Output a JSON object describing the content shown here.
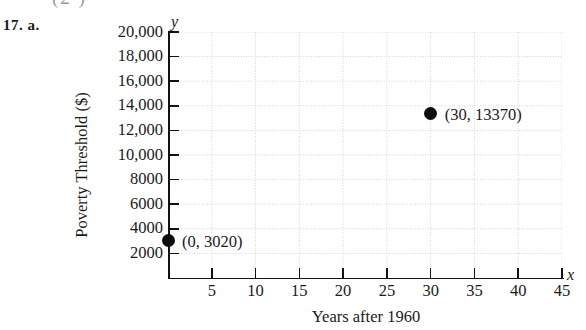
{
  "page": {
    "top_fragment": "(2    )",
    "exercise_label": "17. a."
  },
  "chart_data": {
    "type": "scatter",
    "title": "",
    "xlabel": "Years after 1960",
    "ylabel": "Poverty Threshold ($)",
    "x_axis_symbol": "x",
    "y_axis_symbol": "y",
    "xlim": [
      0,
      45
    ],
    "ylim": [
      0,
      20000
    ],
    "grid": true,
    "grid_style": "dotted",
    "legend": "none",
    "x_ticks": [
      5,
      10,
      15,
      20,
      25,
      30,
      35,
      40,
      45
    ],
    "x_tick_labels": [
      "5",
      "10",
      "15",
      "20",
      "25",
      "30",
      "35",
      "40",
      "45"
    ],
    "y_ticks": [
      2000,
      4000,
      6000,
      8000,
      10000,
      12000,
      14000,
      16000,
      18000,
      20000
    ],
    "y_tick_labels": [
      "2000",
      "4000",
      "6000",
      "8000",
      "10,000",
      "12,000",
      "14,000",
      "16,000",
      "18,000",
      "20,000"
    ],
    "points": [
      {
        "x": 0,
        "y": 3020,
        "label": "(0, 3020)"
      },
      {
        "x": 30,
        "y": 13370,
        "label": "(30, 13370)"
      }
    ],
    "marker_color": "#0d0d0d"
  }
}
